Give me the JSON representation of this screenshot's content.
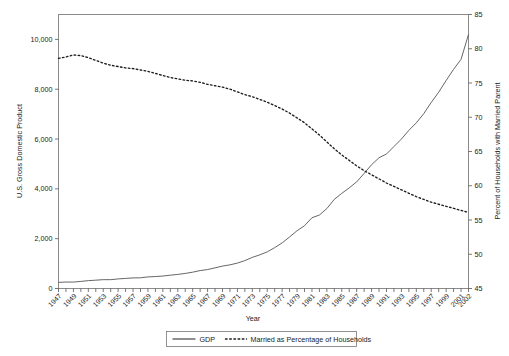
{
  "chart_data": {
    "type": "line",
    "title": "",
    "xlabel": "Year",
    "ylabel": "U.S. Gross Domestic Product",
    "y2label": "Percent of Households with Married Parent",
    "xlim": [
      1947,
      2002
    ],
    "ylim": [
      0,
      11000
    ],
    "y2lim": [
      45,
      85
    ],
    "grid": false,
    "legend_position": "bottom-center",
    "y_ticks": [
      0,
      2000,
      4000,
      6000,
      8000,
      10000
    ],
    "y_tick_labels": [
      "0",
      "2,000",
      "4,000",
      "6,000",
      "8,000",
      "10,000"
    ],
    "y2_ticks": [
      45,
      50,
      55,
      60,
      65,
      70,
      75,
      80,
      85
    ],
    "y2_tick_labels": [
      "45",
      "50",
      "55",
      "60",
      "65",
      "70",
      "75",
      "80",
      "85"
    ],
    "x": [
      1947,
      1948,
      1949,
      1950,
      1951,
      1952,
      1953,
      1954,
      1955,
      1956,
      1957,
      1958,
      1959,
      1960,
      1961,
      1962,
      1963,
      1964,
      1965,
      1966,
      1967,
      1968,
      1969,
      1970,
      1971,
      1972,
      1973,
      1974,
      1975,
      1976,
      1977,
      1978,
      1979,
      1980,
      1981,
      1982,
      1983,
      1984,
      1985,
      1986,
      1987,
      1988,
      1989,
      1990,
      1991,
      1992,
      1993,
      1994,
      1995,
      1996,
      1997,
      1998,
      1999,
      2000,
      2001,
      2002
    ],
    "x_tick_labels": [
      "1947",
      "1949",
      "1951",
      "1953",
      "1955",
      "1957",
      "1959",
      "1961",
      "1963",
      "1965",
      "1967",
      "1969",
      "1971",
      "1973",
      "1975",
      "1977",
      "1979",
      "1981",
      "1983",
      "1985",
      "1987",
      "1989",
      "1991",
      "1993",
      "1995",
      "1997",
      "1999",
      "2001",
      "2002"
    ],
    "series": [
      {
        "name": "GDP",
        "axis": "left",
        "style": "solid",
        "color": "#555555",
        "values": [
          245,
          260,
          258,
          285,
          315,
          335,
          355,
          355,
          385,
          405,
          425,
          430,
          465,
          480,
          500,
          535,
          565,
          605,
          655,
          720,
          760,
          830,
          900,
          950,
          1020,
          1120,
          1250,
          1350,
          1470,
          1640,
          1830,
          2070,
          2320,
          2520,
          2840,
          2950,
          3210,
          3580,
          3820,
          4040,
          4280,
          4620,
          4970,
          5250,
          5400,
          5700,
          6000,
          6350,
          6650,
          7020,
          7470,
          7880,
          8350,
          8800,
          9200,
          10200
        ]
      },
      {
        "name": "Married as Percentage of Households",
        "axis": "right",
        "style": "dotted",
        "color": "#1c1c1c",
        "values": [
          78.6,
          78.8,
          79.1,
          79.0,
          78.7,
          78.3,
          77.9,
          77.6,
          77.4,
          77.2,
          77.1,
          76.9,
          76.7,
          76.4,
          76.1,
          75.8,
          75.6,
          75.4,
          75.3,
          75.1,
          74.8,
          74.6,
          74.4,
          74.1,
          73.7,
          73.3,
          73.0,
          72.6,
          72.2,
          71.7,
          71.2,
          70.6,
          69.9,
          69.2,
          68.3,
          67.4,
          66.4,
          65.4,
          64.5,
          63.7,
          62.9,
          62.2,
          61.6,
          61.0,
          60.4,
          59.9,
          59.4,
          58.9,
          58.4,
          58.0,
          57.6,
          57.3,
          57.0,
          56.7,
          56.4,
          56.1
        ]
      }
    ],
    "legend": [
      {
        "label": "GDP",
        "style": "solid"
      },
      {
        "label": "Married as Percentage of Households",
        "style": "dotted"
      }
    ]
  }
}
